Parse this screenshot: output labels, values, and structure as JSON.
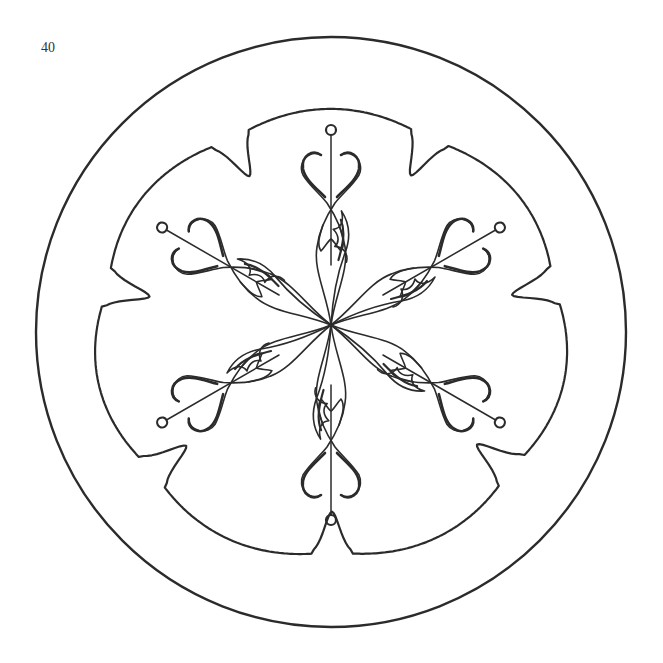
{
  "page": {
    "number": "40",
    "type": "coloring page"
  },
  "drawing": {
    "ink_color": "#2b2b2b",
    "background": "#ffffff",
    "outer_circle": {
      "cx": 331,
      "cy": 332,
      "r": 295
    },
    "border_lobes": 7,
    "motif_arms": 6,
    "center": {
      "x": 331,
      "y": 325
    }
  }
}
